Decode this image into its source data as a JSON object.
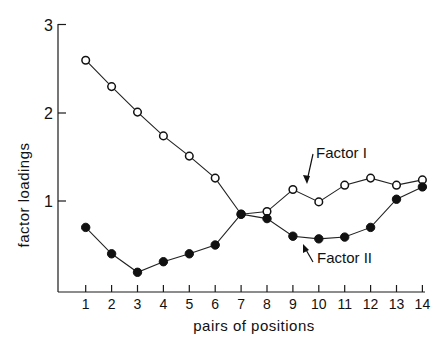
{
  "chart_data": {
    "type": "line",
    "title": "",
    "xlabel": "pairs of positions",
    "ylabel": "factor loadings",
    "x": [
      1,
      2,
      3,
      4,
      5,
      6,
      7,
      8,
      9,
      10,
      11,
      12,
      13,
      14
    ],
    "xticks": [
      "1",
      "2",
      "3",
      "4",
      "5",
      "6",
      "7",
      "8",
      "9",
      "10",
      "11",
      "12",
      "13",
      "14"
    ],
    "yticks": [
      "1",
      "2",
      "3"
    ],
    "ytick_values": [
      1,
      2,
      3
    ],
    "xlim": [
      0,
      14
    ],
    "ylim": [
      0,
      3
    ],
    "grid": false,
    "series": [
      {
        "name": "Factor I",
        "marker": "open-circle",
        "values": [
          2.6,
          2.3,
          2.01,
          1.74,
          1.51,
          1.26,
          0.85,
          0.88,
          1.13,
          0.99,
          1.18,
          1.26,
          1.18,
          1.24
        ]
      },
      {
        "name": "Factor II",
        "marker": "filled-circle",
        "values": [
          0.7,
          0.4,
          0.19,
          0.31,
          0.4,
          0.5,
          0.85,
          0.8,
          0.6,
          0.57,
          0.59,
          0.7,
          1.02,
          1.16
        ]
      }
    ],
    "annotations": [
      {
        "text": "Factor I",
        "points_to_series": "Factor I",
        "near_x": 9
      },
      {
        "text": "Factor II",
        "points_to_series": "Factor II",
        "near_x": 9
      }
    ],
    "legend": "inline-annotations"
  }
}
